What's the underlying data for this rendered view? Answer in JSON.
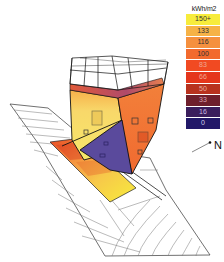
{
  "legend": {
    "unit": "kWh/m2",
    "items": [
      {
        "label": "150+",
        "color": "#f7ec3c",
        "text_color": "#333333"
      },
      {
        "label": "133",
        "color": "#f6b246",
        "text_color": "#333333"
      },
      {
        "label": "116",
        "color": "#f5903e",
        "text_color": "#333333"
      },
      {
        "label": "100",
        "color": "#f26a2e",
        "text_color": "#333333"
      },
      {
        "label": "83",
        "color": "#f14a22",
        "text_color": "#f0a890"
      },
      {
        "label": "66",
        "color": "#e5361c",
        "text_color": "#f0a890"
      },
      {
        "label": "50",
        "color": "#b8321e",
        "text_color": "#e8b0a0"
      },
      {
        "label": "33",
        "color": "#6e1f2c",
        "text_color": "#d8a0b0"
      },
      {
        "label": "16",
        "color": "#3a1e5c",
        "text_color": "#c8b8e0"
      },
      {
        "label": "0",
        "color": "#221868",
        "text_color": "#d0d0f0"
      }
    ]
  },
  "north_arrow": {
    "label": "N"
  },
  "diagram": {
    "type": "solar radiation analysis",
    "colors": {
      "high": "#f7ec3c",
      "mid": "#f5903e",
      "low": "#221868",
      "shade": "#5a4a9c",
      "outline": "#111111",
      "terrain_line": "#666666"
    }
  }
}
